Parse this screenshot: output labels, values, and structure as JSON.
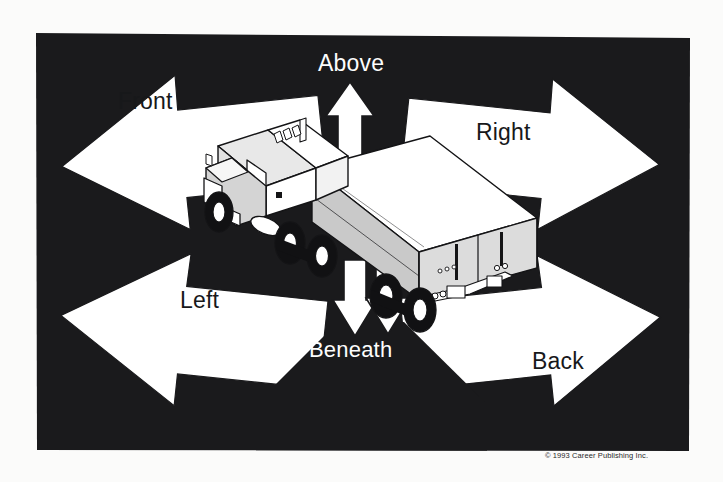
{
  "figure": {
    "kind": "instructional-diagram",
    "background_color": "#fbfbfa",
    "field_color": "#1a1a1c",
    "arrow_fill": "#ffffff",
    "arrow_stroke": "#1a1a1c",
    "truck": {
      "body_light": "#ffffff",
      "body_mid": "#c9c9c9",
      "body_shadow": "#9a9a9a",
      "outline": "#141416",
      "tire": "#111113"
    }
  },
  "labels": {
    "front": {
      "text": "Front",
      "color": "#17181a",
      "on": "white-arrow"
    },
    "above": {
      "text": "Above",
      "color": "#fdfdfd",
      "on": "black-field"
    },
    "right": {
      "text": "Right",
      "color": "#17181a",
      "on": "white-arrow"
    },
    "left": {
      "text": "Left",
      "color": "#17181a",
      "on": "white-arrow"
    },
    "beneath": {
      "text": "Beneath",
      "color": "#fdfdfd",
      "on": "black-arrow"
    },
    "back": {
      "text": "Back",
      "color": "#17181a",
      "on": "white-arrow"
    }
  },
  "footer": {
    "copyright": "© 1993 Career Publishing Inc."
  }
}
